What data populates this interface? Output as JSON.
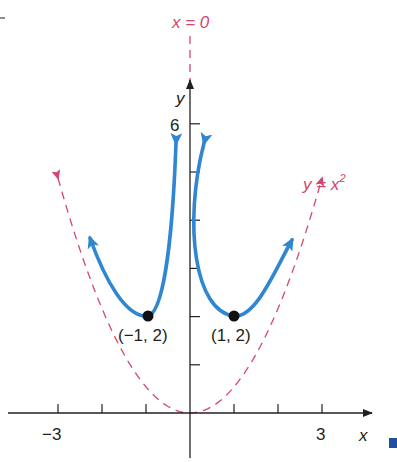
{
  "chart_data": {
    "type": "line",
    "title": "",
    "xlabel": "x",
    "ylabel": "y",
    "xlim": [
      -4,
      4
    ],
    "ylim": [
      0,
      7
    ],
    "x_ticks": [
      -3,
      -2,
      -1,
      0,
      1,
      2,
      3
    ],
    "x_tick_labels": [
      "-3",
      "3"
    ],
    "y_ticks": [
      1,
      2,
      3,
      4,
      5,
      6
    ],
    "y_tick_labels": [
      "6"
    ],
    "series": [
      {
        "name": "f(x) = x^2 + 1/x^2 (left branch)",
        "style": "solid",
        "color": "#2f86d1",
        "x": [
          -2.1,
          -1.8,
          -1.5,
          -1.25,
          -1.0,
          -0.8,
          -0.6,
          -0.5,
          -0.42
        ],
        "y": [
          3.7,
          3.3,
          2.8,
          2.3,
          2.0,
          2.2,
          3.1,
          4.2,
          5.7
        ]
      },
      {
        "name": "f(x) = x^2 + 1/x^2 (right branch)",
        "style": "solid",
        "color": "#2f86d1",
        "x": [
          0.42,
          0.5,
          0.6,
          0.8,
          1.0,
          1.25,
          1.5,
          1.8,
          2.1
        ],
        "y": [
          5.7,
          4.2,
          3.1,
          2.2,
          2.0,
          2.3,
          2.8,
          3.3,
          3.7
        ]
      },
      {
        "name": "y = x^2",
        "style": "dashed",
        "color": "#d4456f",
        "role": "asymptote",
        "x": [
          -3,
          -2,
          -1,
          0,
          1,
          2,
          3
        ],
        "y": [
          4.9,
          2.2,
          0.55,
          0,
          0.55,
          2.2,
          4.9
        ]
      },
      {
        "name": "x = 0",
        "style": "dashed",
        "color": "#d4456f",
        "role": "asymptote"
      }
    ],
    "points": [
      {
        "x": -1,
        "y": 2,
        "label": "(−1, 2)"
      },
      {
        "x": 1,
        "y": 2,
        "label": "(1, 2)"
      }
    ],
    "annotations": [
      "x = 0",
      "y = x²"
    ]
  },
  "labels": {
    "vert_asym": "x = 0",
    "parab_y": "y = x",
    "parab_exp": "2",
    "y_axis": "y",
    "x_axis": "x",
    "tick_6": "6",
    "tick_neg3": "−3",
    "tick_3": "3",
    "pt_left": "(−1, 2)",
    "pt_right": "(1, 2)"
  },
  "colors": {
    "curve": "#2f86d1",
    "asymptote": "#d4456f",
    "axis": "#231f20",
    "marker": "#1f4fa0"
  }
}
